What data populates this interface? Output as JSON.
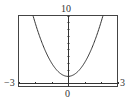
{
  "chart_data": {
    "type": "line",
    "title": "",
    "xlabel": "",
    "ylabel": "",
    "xlim": [
      -3,
      3
    ],
    "ylim": [
      -0.5,
      10
    ],
    "grid": false,
    "series": [
      {
        "name": "y = 2x^2 + 1",
        "function": "2*x^2 + 1",
        "x": [
          -2.12,
          -2,
          -1.5,
          -1,
          -0.5,
          0,
          0.5,
          1,
          1.5,
          2,
          2.12
        ],
        "y": [
          10,
          9,
          5.5,
          3,
          1.5,
          1,
          1.5,
          3,
          5.5,
          9,
          10
        ]
      }
    ],
    "tick_labels": {
      "xmin": "-3",
      "xmax": "3",
      "x_origin": "0",
      "ymax": "10"
    },
    "x_ticks": [
      -3,
      -2,
      -1,
      0,
      1,
      2,
      3
    ],
    "y_ticks": [
      1,
      2,
      3,
      4,
      5,
      6,
      7,
      8,
      9,
      10
    ]
  },
  "labels": {
    "ymax": "10",
    "xmin": "−3",
    "xmax": "3",
    "origin": "0"
  },
  "colors": {
    "curve": "#333333",
    "axis": "#333333",
    "frame": "#444444"
  }
}
